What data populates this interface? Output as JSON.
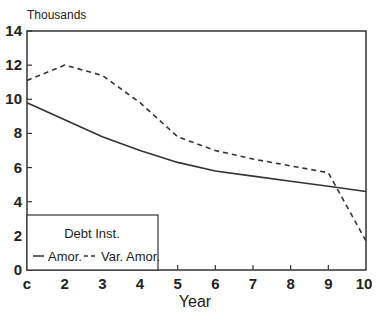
{
  "chart_data": {
    "type": "line",
    "title": "",
    "unit_label": "Thousands",
    "xlabel": "Year",
    "ylabel": "Thousands",
    "x": [
      1,
      2,
      3,
      4,
      5,
      6,
      7,
      8,
      9,
      10
    ],
    "x_tick_labels": [
      "c",
      "2",
      "3",
      "4",
      "5",
      "6",
      "7",
      "8",
      "9",
      "10"
    ],
    "y_ticks": [
      0,
      2,
      4,
      6,
      8,
      10,
      12,
      14
    ],
    "y_tick_labels": [
      "0",
      "2",
      "4",
      "6",
      "8",
      "10",
      "12",
      "14"
    ],
    "ylim": [
      0,
      14
    ],
    "xlim": [
      1,
      10
    ],
    "grid": false,
    "legend": {
      "title": "Debt Inst.",
      "position": "lower-left",
      "entries": [
        "Amor.",
        "Var. Amor."
      ]
    },
    "series": [
      {
        "name": "Amor.",
        "style": "solid",
        "values": [
          9.8,
          8.8,
          7.8,
          7.0,
          6.3,
          5.8,
          5.5,
          5.2,
          4.9,
          4.6
        ]
      },
      {
        "name": "Var. Amor.",
        "style": "dashed",
        "values": [
          11.1,
          12.0,
          11.4,
          9.8,
          7.8,
          7.0,
          6.5,
          6.1,
          5.7,
          1.7
        ]
      }
    ]
  }
}
